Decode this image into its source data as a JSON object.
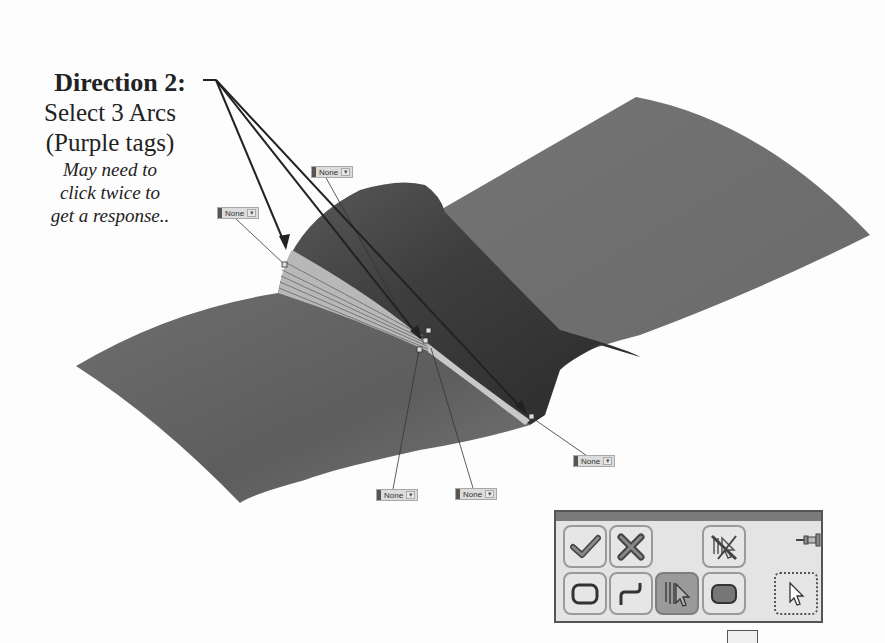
{
  "callout": {
    "title": "Direction 2:",
    "line1": "Select 3 Arcs",
    "line2": "(Purple tags)",
    "note1": "May need to",
    "note2": "click twice to",
    "note3": "get a response.."
  },
  "tags": [
    {
      "id": "tag-left",
      "label": "None",
      "x": 217,
      "y": 207
    },
    {
      "id": "tag-top",
      "label": "None",
      "x": 311,
      "y": 166
    },
    {
      "id": "tag-bottom-left",
      "label": "None",
      "x": 376,
      "y": 489
    },
    {
      "id": "tag-bottom-mid",
      "label": "None",
      "x": 455,
      "y": 488
    },
    {
      "id": "tag-right",
      "label": "None",
      "x": 573,
      "y": 455
    }
  ],
  "toolbar": {
    "buttons": [
      {
        "name": "ok-button",
        "icon": "checkmark-icon",
        "row": 0,
        "col": 0
      },
      {
        "name": "cancel-button",
        "icon": "x-icon",
        "row": 0,
        "col": 1
      },
      {
        "name": "clear-selection-button",
        "icon": "no-select-icon",
        "row": 0,
        "col": 3
      },
      {
        "name": "closed-loop-button",
        "icon": "closed-loop-icon",
        "row": 1,
        "col": 0
      },
      {
        "name": "open-loop-button",
        "icon": "open-loop-icon",
        "row": 1,
        "col": 1
      },
      {
        "name": "selection-manager-button",
        "icon": "multi-select-icon",
        "row": 1,
        "col": 2,
        "active": true
      },
      {
        "name": "region-button",
        "icon": "region-icon",
        "row": 1,
        "col": 3
      },
      {
        "name": "standard-select-button",
        "icon": "pointer-icon",
        "row": 1,
        "col": 4
      }
    ],
    "colors": {
      "frame": "#555555",
      "titlebar": "#7a7a7a",
      "active": "#9a9a9a"
    }
  }
}
